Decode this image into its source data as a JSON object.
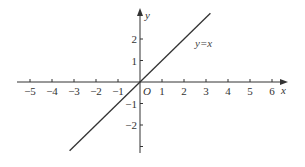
{
  "chart_data": {
    "type": "line",
    "title": "",
    "xlabel": "x",
    "ylabel": "y",
    "origin_label": "O",
    "xlim": [
      -5.5,
      6.2
    ],
    "ylim": [
      -3.3,
      3.3
    ],
    "grid": false,
    "legend": null,
    "x_ticks": [
      -5,
      -4,
      -3,
      -2,
      -1,
      1,
      2,
      3,
      4,
      5,
      6
    ],
    "x_tick_labels": [
      "−5",
      "−4",
      "−3",
      "−2",
      "−1",
      "1",
      "2",
      "3",
      "4",
      "5",
      "6"
    ],
    "y_ticks": [
      -3,
      -2,
      -1,
      1,
      2
    ],
    "y_tick_labels": [
      "",
      "−2",
      "−1",
      "1",
      "2"
    ],
    "series": [
      {
        "name": "y=x",
        "x": [
          -3.2,
          3.2
        ],
        "y": [
          -3.2,
          3.2
        ]
      }
    ],
    "annotations": [
      {
        "text": "y=x",
        "x": 2.5,
        "y": 1.8
      }
    ]
  }
}
